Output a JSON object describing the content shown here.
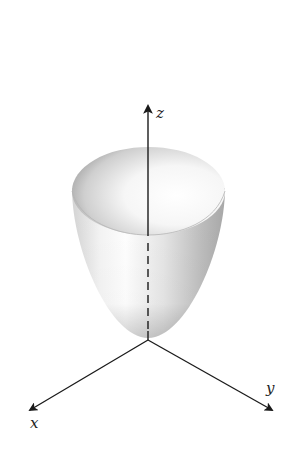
{
  "figure": {
    "title": "",
    "axes": {
      "x": {
        "label": "x"
      },
      "y": {
        "label": "y"
      },
      "z": {
        "label": "z"
      }
    },
    "colors": {
      "axis": "#1a1a1a",
      "surface_light": "#ffffff",
      "surface_mid": "#d9d9d9",
      "surface_dark": "#9a9a9a",
      "background": "#ffffff"
    }
  }
}
